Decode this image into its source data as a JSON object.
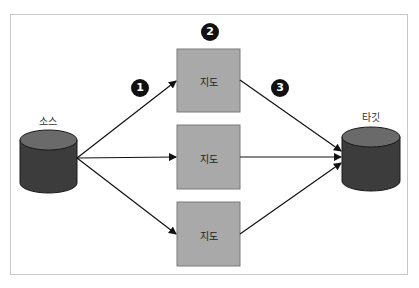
{
  "source": {
    "label": "소스"
  },
  "target": {
    "label": "타깃"
  },
  "map_boxes": [
    {
      "label": "지도"
    },
    {
      "label": "지도"
    },
    {
      "label": "지도"
    }
  ],
  "badges": [
    {
      "number": "1"
    },
    {
      "number": "2"
    },
    {
      "number": "3"
    }
  ],
  "colors": {
    "box_fill": "#a9a9a9",
    "box_border": "#7a7a7a",
    "cylinder_body": "#3c3c3c",
    "cylinder_top": "#6a6a6a",
    "badge": "#111111",
    "frame": "#c8c8c8"
  }
}
